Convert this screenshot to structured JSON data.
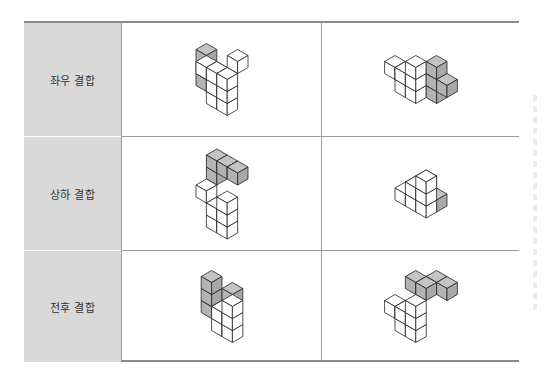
{
  "table": {
    "rows": [
      {
        "label": "좌우 결합",
        "figures": [
          {
            "name": "left-right-figure-a",
            "cubes": [
              {
                "x": 0,
                "y": 0,
                "z": 0,
                "c": "g"
              },
              {
                "x": 0,
                "y": 0,
                "z": 1,
                "c": "g"
              },
              {
                "x": 0,
                "y": 0,
                "z": 2,
                "c": "g"
              },
              {
                "x": 1,
                "y": 0,
                "z": 1,
                "c": "g"
              },
              {
                "x": 1,
                "y": 1,
                "z": 2,
                "c": "w"
              },
              {
                "x": 2,
                "y": 1,
                "z": 0,
                "c": "w"
              },
              {
                "x": 2,
                "y": 1,
                "z": 1,
                "c": "w"
              },
              {
                "x": 2,
                "y": 1,
                "z": 2,
                "c": "w"
              },
              {
                "x": 3,
                "y": 1,
                "z": 0,
                "c": "w"
              },
              {
                "x": 3,
                "y": 1,
                "z": 1,
                "c": "w"
              },
              {
                "x": 3,
                "y": 1,
                "z": 2,
                "c": "w"
              },
              {
                "x": 3,
                "y": 0,
                "z": 3,
                "c": "w"
              }
            ]
          },
          {
            "name": "left-right-figure-b",
            "cubes": [
              {
                "x": 0,
                "y": 1,
                "z": 1,
                "c": "w"
              },
              {
                "x": 1,
                "y": 1,
                "z": 1,
                "c": "w"
              },
              {
                "x": 1,
                "y": 1,
                "z": 0,
                "c": "w"
              },
              {
                "x": 2,
                "y": 1,
                "z": 0,
                "c": "w"
              },
              {
                "x": 2,
                "y": 1,
                "z": 1,
                "c": "w"
              },
              {
                "x": 2,
                "y": 1,
                "z": 2,
                "c": "w"
              },
              {
                "x": 3,
                "y": 0,
                "z": 0,
                "c": "g"
              },
              {
                "x": 3,
                "y": 0,
                "z": 1,
                "c": "g"
              },
              {
                "x": 3,
                "y": 0,
                "z": 2,
                "c": "g"
              },
              {
                "x": 4,
                "y": 0,
                "z": 1,
                "c": "g"
              }
            ]
          }
        ]
      },
      {
        "label": "상하 결합",
        "figures": [
          {
            "name": "top-bottom-figure-a",
            "cubes": [
              {
                "x": 1,
                "y": 1,
                "z": 0,
                "c": "w"
              },
              {
                "x": 1,
                "y": 1,
                "z": 1,
                "c": "w"
              },
              {
                "x": 2,
                "y": 1,
                "z": 0,
                "c": "w"
              },
              {
                "x": 2,
                "y": 1,
                "z": 1,
                "c": "w"
              },
              {
                "x": 2,
                "y": 1,
                "z": 2,
                "c": "w"
              },
              {
                "x": 0,
                "y": 1,
                "z": 2,
                "c": "w"
              },
              {
                "x": 0,
                "y": 0,
                "z": 3,
                "c": "g"
              },
              {
                "x": 0,
                "y": 0,
                "z": 4,
                "c": "g"
              },
              {
                "x": 1,
                "y": 0,
                "z": 4,
                "c": "g"
              },
              {
                "x": 2,
                "y": 0,
                "z": 4,
                "c": "g"
              }
            ]
          },
          {
            "name": "top-bottom-figure-b",
            "cubes": [
              {
                "x": 1,
                "y": 2,
                "z": 1,
                "c": "w"
              },
              {
                "x": 2,
                "y": 2,
                "z": 1,
                "c": "w"
              },
              {
                "x": 2,
                "y": 2,
                "z": 2,
                "c": "w"
              },
              {
                "x": 3,
                "y": 2,
                "z": 1,
                "c": "w"
              },
              {
                "x": 3,
                "y": 2,
                "z": 2,
                "c": "w"
              },
              {
                "x": 3,
                "y": 2,
                "z": 3,
                "c": "w"
              },
              {
                "x": 0,
                "y": 0,
                "z": 0,
                "c": "g"
              },
              {
                "x": 1,
                "y": 0,
                "z": 0,
                "c": "g"
              },
              {
                "x": 1,
                "y": 0,
                "z": 1,
                "c": "g"
              },
              {
                "x": 2,
                "y": 0,
                "z": 0,
                "c": "g"
              }
            ]
          }
        ]
      },
      {
        "label": "전후 결합",
        "figures": [
          {
            "name": "front-back-figure-a",
            "cubes": [
              {
                "x": 0,
                "y": 0,
                "z": 0,
                "c": "g"
              },
              {
                "x": 0,
                "y": 0,
                "z": 1,
                "c": "g"
              },
              {
                "x": 0,
                "y": 0,
                "z": 2,
                "c": "g"
              },
              {
                "x": 1,
                "y": -1,
                "z": 1,
                "c": "g"
              },
              {
                "x": 2,
                "y": 1,
                "z": 0,
                "c": "w"
              },
              {
                "x": 2,
                "y": 1,
                "z": 1,
                "c": "w"
              },
              {
                "x": 3,
                "y": 1,
                "z": 0,
                "c": "w"
              },
              {
                "x": 3,
                "y": 1,
                "z": 1,
                "c": "w"
              },
              {
                "x": 3,
                "y": 1,
                "z": 2,
                "c": "w"
              }
            ]
          },
          {
            "name": "front-back-figure-b",
            "cubes": [
              {
                "x": 0,
                "y": 0,
                "z": 2,
                "c": "g"
              },
              {
                "x": 1,
                "y": 0,
                "z": 2,
                "c": "g"
              },
              {
                "x": 1,
                "y": -1,
                "z": 2,
                "c": "g"
              },
              {
                "x": 2,
                "y": -1,
                "z": 2,
                "c": "g"
              },
              {
                "x": 0,
                "y": 2,
                "z": 1,
                "c": "w"
              },
              {
                "x": 1,
                "y": 2,
                "z": 0,
                "c": "w"
              },
              {
                "x": 1,
                "y": 2,
                "z": 1,
                "c": "w"
              },
              {
                "x": 2,
                "y": 2,
                "z": 0,
                "c": "w"
              },
              {
                "x": 2,
                "y": 2,
                "z": 1,
                "c": "w"
              },
              {
                "x": 2,
                "y": 2,
                "z": 2,
                "c": "w"
              }
            ]
          }
        ]
      }
    ]
  },
  "colors": {
    "gray_top": "#c4c4c4",
    "gray_left": "#b3b3b3",
    "gray_right": "#a8a8a8",
    "white": "#ffffff",
    "edge": "#222222",
    "label_bg": "#d9d9d9"
  }
}
